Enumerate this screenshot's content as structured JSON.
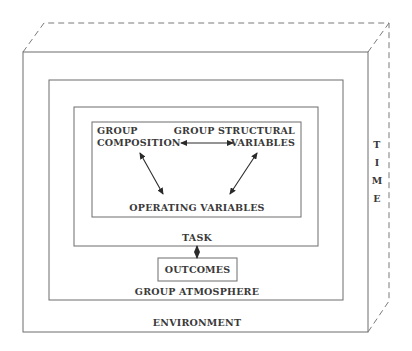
{
  "diagram": {
    "type": "nested-box-model",
    "layers": {
      "time": {
        "label_letters": [
          "T",
          "I",
          "M",
          "E"
        ]
      },
      "environment": {
        "label": "ENVIRONMENT"
      },
      "group_atmosphere": {
        "label": "GROUP ATMOSPHERE"
      },
      "task": {
        "label": "TASK"
      },
      "core": {
        "group_composition": {
          "line1": "GROUP",
          "line2": "COMPOSITION"
        },
        "group_structural_variables": {
          "line1": "GROUP STRUCTURAL",
          "line2": "VARIABLES"
        },
        "operating_variables": {
          "label": "OPERATING VARIABLES"
        }
      }
    },
    "outcomes": {
      "label": "OUTCOMES"
    },
    "relations": [
      {
        "from": "GROUP COMPOSITION",
        "to": "GROUP STRUCTURAL VARIABLES",
        "type": "bidirectional"
      },
      {
        "from": "GROUP COMPOSITION",
        "to": "OPERATING VARIABLES",
        "type": "bidirectional"
      },
      {
        "from": "GROUP STRUCTURAL VARIABLES",
        "to": "OPERATING VARIABLES",
        "type": "bidirectional"
      },
      {
        "from": "TASK",
        "to": "OUTCOMES",
        "type": "bidirectional"
      }
    ]
  }
}
